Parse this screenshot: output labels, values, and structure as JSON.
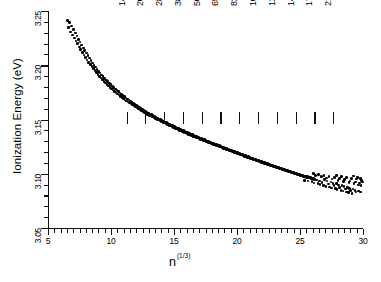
{
  "chart_data": {
    "type": "scatter",
    "title": "",
    "xlabel": "n (1/3)",
    "xlabel_base": "n",
    "xlabel_sup": "(1/3)",
    "ylabel": "Ionization Energy (eV)",
    "xlim": [
      5,
      30
    ],
    "ylim": [
      3.05,
      3.25
    ],
    "xticks": [
      5,
      10,
      15,
      20,
      25,
      30
    ],
    "xtick_labels": [
      "5",
      "10",
      "15",
      "20",
      "25",
      "30"
    ],
    "yticks": [
      3.05,
      3.1,
      3.15,
      3.2,
      3.25
    ],
    "ytick_labels": [
      "3.05",
      "3.10",
      "3.15",
      "3.20",
      "3.25"
    ],
    "x_minor_step": 0.5,
    "y_minor_step": 0.01,
    "grid": false,
    "legend": false,
    "marker": "filled-circle",
    "marker_color": "#000000",
    "annotations": [
      {
        "label": "1415",
        "n13": 11.23
      },
      {
        "label": "2057",
        "n13": 12.71
      },
      {
        "label": "2869",
        "n13": 14.2
      },
      {
        "label": "3871",
        "n13": 15.7
      },
      {
        "label": "5083",
        "n13": 17.19
      },
      {
        "label": "6525",
        "n13": 18.68
      },
      {
        "label": "8217",
        "n13": 20.18
      },
      {
        "label": "10179",
        "n13": 21.67
      },
      {
        "label": "12431",
        "n13": 23.16
      },
      {
        "label": "14993",
        "n13": 24.66
      },
      {
        "label": "17885",
        "n13": 26.15
      },
      {
        "label": "21127",
        "n13": 27.64
      }
    ],
    "points": [
      [
        6.55,
        3.2415
      ],
      [
        6.72,
        3.2392
      ],
      [
        6.62,
        3.235
      ],
      [
        6.88,
        3.2362
      ],
      [
        6.78,
        3.2305
      ],
      [
        7.02,
        3.233
      ],
      [
        6.95,
        3.228
      ],
      [
        7.18,
        3.2298
      ],
      [
        7.08,
        3.2252
      ],
      [
        7.3,
        3.227
      ],
      [
        7.22,
        3.2225
      ],
      [
        7.42,
        3.2238
      ],
      [
        7.35,
        3.2198
      ],
      [
        7.55,
        3.2215
      ],
      [
        7.48,
        3.217
      ],
      [
        7.68,
        3.2185
      ],
      [
        7.6,
        3.2145
      ],
      [
        7.8,
        3.216
      ],
      [
        7.73,
        3.212
      ],
      [
        7.92,
        3.2138
      ],
      [
        7.85,
        3.2095
      ],
      [
        8.05,
        3.2112
      ],
      [
        7.98,
        3.2072
      ],
      [
        8.18,
        3.209
      ],
      [
        8.1,
        3.205
      ],
      [
        8.3,
        3.2065
      ],
      [
        8.23,
        3.2028
      ],
      [
        8.42,
        3.2045
      ],
      [
        8.35,
        3.2008
      ],
      [
        8.55,
        3.2022
      ],
      [
        8.48,
        3.1988
      ],
      [
        8.66,
        3.2
      ],
      [
        8.6,
        3.1968
      ],
      [
        8.78,
        3.1982
      ],
      [
        8.72,
        3.195
      ],
      [
        8.9,
        3.1962
      ],
      [
        8.84,
        3.1932
      ],
      [
        9.02,
        3.1945
      ],
      [
        8.96,
        3.1915
      ],
      [
        9.14,
        3.1928
      ],
      [
        9.08,
        3.1898
      ],
      [
        9.26,
        3.191
      ],
      [
        9.2,
        3.1882
      ],
      [
        9.38,
        3.1895
      ],
      [
        9.32,
        3.1866
      ],
      [
        9.5,
        3.1878
      ],
      [
        9.44,
        3.185
      ],
      [
        9.62,
        3.1862
      ],
      [
        9.56,
        3.1836
      ],
      [
        9.74,
        3.1848
      ],
      [
        9.68,
        3.1822
      ],
      [
        9.86,
        3.1834
      ],
      [
        9.8,
        3.1808
      ],
      [
        9.98,
        3.182
      ],
      [
        9.92,
        3.1795
      ],
      [
        10.1,
        3.1806
      ],
      [
        10.04,
        3.1782
      ],
      [
        10.22,
        3.1793
      ],
      [
        10.16,
        3.177
      ],
      [
        10.34,
        3.178
      ],
      [
        10.28,
        3.1758
      ],
      [
        10.46,
        3.1768
      ],
      [
        10.4,
        3.1746
      ],
      [
        10.58,
        3.1756
      ],
      [
        10.52,
        3.1735
      ],
      [
        10.7,
        3.1744
      ],
      [
        10.64,
        3.1724
      ],
      [
        10.82,
        3.1732
      ],
      [
        10.76,
        3.1713
      ],
      [
        10.94,
        3.1721
      ],
      [
        10.88,
        3.1702
      ],
      [
        11.06,
        3.171
      ],
      [
        11.0,
        3.1692
      ],
      [
        11.18,
        3.1699
      ],
      [
        11.12,
        3.1681
      ],
      [
        11.3,
        3.1688
      ],
      [
        11.24,
        3.1671
      ],
      [
        11.42,
        3.1678
      ],
      [
        11.36,
        3.1661
      ],
      [
        11.54,
        3.1668
      ],
      [
        11.48,
        3.1651
      ],
      [
        11.66,
        3.1658
      ],
      [
        11.6,
        3.1642
      ],
      [
        11.78,
        3.1648
      ],
      [
        11.72,
        3.1632
      ],
      [
        11.9,
        3.1638
      ],
      [
        11.84,
        3.1623
      ],
      [
        12.02,
        3.1629
      ],
      [
        11.96,
        3.1614
      ],
      [
        12.14,
        3.162
      ],
      [
        12.08,
        3.1605
      ],
      [
        12.26,
        3.1611
      ],
      [
        12.2,
        3.1596
      ],
      [
        12.38,
        3.1602
      ],
      [
        12.32,
        3.1588
      ],
      [
        12.5,
        3.1593
      ],
      [
        12.44,
        3.1579
      ],
      [
        12.62,
        3.1585
      ],
      [
        12.56,
        3.1571
      ],
      [
        12.74,
        3.1576
      ],
      [
        12.68,
        3.1563
      ],
      [
        12.86,
        3.1568
      ],
      [
        12.8,
        3.1555
      ],
      [
        12.98,
        3.156
      ],
      [
        12.92,
        3.1547
      ],
      [
        13.1,
        3.1552
      ],
      [
        13.04,
        3.1539
      ],
      [
        13.22,
        3.1544
      ],
      [
        13.16,
        3.1531
      ],
      [
        13.34,
        3.1536
      ],
      [
        13.28,
        3.1524
      ],
      [
        13.46,
        3.1528
      ],
      [
        13.4,
        3.1516
      ],
      [
        13.58,
        3.1521
      ],
      [
        13.52,
        3.1509
      ],
      [
        13.7,
        3.1513
      ],
      [
        13.64,
        3.1501
      ],
      [
        13.82,
        3.1506
      ],
      [
        13.76,
        3.1494
      ],
      [
        13.94,
        3.1498
      ],
      [
        13.88,
        3.1487
      ],
      [
        14.06,
        3.1491
      ],
      [
        14.0,
        3.148
      ],
      [
        14.18,
        3.1484
      ],
      [
        14.12,
        3.1473
      ],
      [
        14.3,
        3.1477
      ],
      [
        14.24,
        3.1466
      ],
      [
        14.42,
        3.147
      ],
      [
        14.36,
        3.1459
      ],
      [
        14.54,
        3.1463
      ],
      [
        14.48,
        3.1452
      ],
      [
        14.66,
        3.1456
      ],
      [
        14.6,
        3.1446
      ],
      [
        14.78,
        3.1449
      ],
      [
        14.72,
        3.1439
      ],
      [
        14.9,
        3.1442
      ],
      [
        14.84,
        3.1432
      ],
      [
        15.02,
        3.1436
      ],
      [
        14.96,
        3.1426
      ],
      [
        15.14,
        3.1429
      ],
      [
        15.08,
        3.1419
      ],
      [
        15.26,
        3.1422
      ],
      [
        15.2,
        3.1412
      ],
      [
        15.38,
        3.1416
      ],
      [
        15.32,
        3.1406
      ],
      [
        15.5,
        3.1409
      ],
      [
        15.44,
        3.14
      ],
      [
        15.62,
        3.1403
      ],
      [
        15.56,
        3.1394
      ],
      [
        15.74,
        3.1397
      ],
      [
        15.68,
        3.1388
      ],
      [
        15.86,
        3.1391
      ],
      [
        15.8,
        3.1381
      ],
      [
        15.98,
        3.1385
      ],
      [
        15.92,
        3.1375
      ],
      [
        16.1,
        3.1378
      ],
      [
        16.04,
        3.1369
      ],
      [
        16.22,
        3.1372
      ],
      [
        16.16,
        3.1363
      ],
      [
        16.34,
        3.1366
      ],
      [
        16.28,
        3.1357
      ],
      [
        16.46,
        3.136
      ],
      [
        16.4,
        3.1351
      ],
      [
        16.58,
        3.1354
      ],
      [
        16.52,
        3.1345
      ],
      [
        16.7,
        3.1348
      ],
      [
        16.64,
        3.1339
      ],
      [
        16.82,
        3.1342
      ],
      [
        16.76,
        3.1334
      ],
      [
        16.94,
        3.1336
      ],
      [
        16.88,
        3.1328
      ],
      [
        17.06,
        3.133
      ],
      [
        17.0,
        3.1322
      ],
      [
        17.18,
        3.1325
      ],
      [
        17.12,
        3.1316
      ],
      [
        17.3,
        3.1319
      ],
      [
        17.24,
        3.1311
      ],
      [
        17.42,
        3.1313
      ],
      [
        17.36,
        3.1305
      ],
      [
        17.54,
        3.1308
      ],
      [
        17.48,
        3.13
      ],
      [
        17.66,
        3.1302
      ],
      [
        17.6,
        3.1294
      ],
      [
        17.78,
        3.1296
      ],
      [
        17.72,
        3.1288
      ],
      [
        17.9,
        3.1291
      ],
      [
        17.84,
        3.1283
      ],
      [
        18.02,
        3.1285
      ],
      [
        17.96,
        3.1277
      ],
      [
        18.14,
        3.128
      ],
      [
        18.08,
        3.1272
      ],
      [
        18.26,
        3.1274
      ],
      [
        18.2,
        3.1266
      ],
      [
        18.38,
        3.1269
      ],
      [
        18.32,
        3.1261
      ],
      [
        18.5,
        3.1263
      ],
      [
        18.44,
        3.1256
      ],
      [
        18.62,
        3.1258
      ],
      [
        18.56,
        3.125
      ],
      [
        18.74,
        3.1252
      ],
      [
        18.68,
        3.1245
      ],
      [
        18.86,
        3.1247
      ],
      [
        18.8,
        3.1239
      ],
      [
        18.98,
        3.1241
      ],
      [
        18.92,
        3.1234
      ],
      [
        19.1,
        3.1236
      ],
      [
        19.04,
        3.1229
      ],
      [
        19.22,
        3.1231
      ],
      [
        19.16,
        3.1223
      ],
      [
        19.34,
        3.1226
      ],
      [
        19.28,
        3.1218
      ],
      [
        19.46,
        3.122
      ],
      [
        19.4,
        3.1213
      ],
      [
        19.58,
        3.1215
      ],
      [
        19.52,
        3.1208
      ],
      [
        19.7,
        3.121
      ],
      [
        19.64,
        3.1202
      ],
      [
        19.82,
        3.1204
      ],
      [
        19.76,
        3.1197
      ],
      [
        19.94,
        3.1199
      ],
      [
        19.88,
        3.1192
      ],
      [
        20.06,
        3.1194
      ],
      [
        20.0,
        3.1187
      ],
      [
        20.18,
        3.1189
      ],
      [
        20.12,
        3.1182
      ],
      [
        20.3,
        3.1183
      ],
      [
        20.24,
        3.1176
      ],
      [
        20.42,
        3.1178
      ],
      [
        20.36,
        3.1171
      ],
      [
        20.54,
        3.1173
      ],
      [
        20.48,
        3.1166
      ],
      [
        20.66,
        3.1168
      ],
      [
        20.6,
        3.1161
      ],
      [
        20.78,
        3.1163
      ],
      [
        20.72,
        3.1156
      ],
      [
        20.9,
        3.1158
      ],
      [
        20.84,
        3.1151
      ],
      [
        21.02,
        3.1152
      ],
      [
        20.96,
        3.1146
      ],
      [
        21.14,
        3.1147
      ],
      [
        21.08,
        3.1141
      ],
      [
        21.26,
        3.1142
      ],
      [
        21.2,
        3.1136
      ],
      [
        21.38,
        3.1137
      ],
      [
        21.32,
        3.1131
      ],
      [
        21.5,
        3.1132
      ],
      [
        21.44,
        3.1126
      ],
      [
        21.62,
        3.1127
      ],
      [
        21.56,
        3.1121
      ],
      [
        21.74,
        3.1122
      ],
      [
        21.68,
        3.1116
      ],
      [
        21.86,
        3.1117
      ],
      [
        21.8,
        3.1111
      ],
      [
        21.98,
        3.1112
      ],
      [
        21.92,
        3.1106
      ],
      [
        22.1,
        3.1107
      ],
      [
        22.04,
        3.1101
      ],
      [
        22.22,
        3.1102
      ],
      [
        22.16,
        3.1096
      ],
      [
        22.34,
        3.1097
      ],
      [
        22.28,
        3.1091
      ],
      [
        22.46,
        3.1092
      ],
      [
        22.4,
        3.1086
      ],
      [
        22.58,
        3.1087
      ],
      [
        22.52,
        3.1081
      ],
      [
        22.7,
        3.1082
      ],
      [
        22.64,
        3.1076
      ],
      [
        22.82,
        3.1077
      ],
      [
        22.76,
        3.1071
      ],
      [
        22.94,
        3.1072
      ],
      [
        22.88,
        3.1067
      ],
      [
        23.06,
        3.1067
      ],
      [
        23.0,
        3.1062
      ],
      [
        23.18,
        3.1062
      ],
      [
        23.12,
        3.1057
      ],
      [
        23.3,
        3.1057
      ],
      [
        23.24,
        3.1052
      ],
      [
        23.42,
        3.1052
      ],
      [
        23.36,
        3.1047
      ],
      [
        23.54,
        3.1048
      ],
      [
        23.48,
        3.1042
      ],
      [
        23.66,
        3.1043
      ],
      [
        23.6,
        3.1038
      ],
      [
        23.78,
        3.1038
      ],
      [
        23.72,
        3.1033
      ],
      [
        23.9,
        3.1033
      ],
      [
        23.84,
        3.1028
      ],
      [
        24.02,
        3.1029
      ],
      [
        23.96,
        3.1024
      ],
      [
        24.14,
        3.1024
      ],
      [
        24.08,
        3.1019
      ],
      [
        24.26,
        3.1019
      ],
      [
        24.2,
        3.1015
      ],
      [
        24.38,
        3.1015
      ],
      [
        24.32,
        3.101
      ],
      [
        24.5,
        3.101
      ],
      [
        24.44,
        3.1006
      ],
      [
        24.62,
        3.1006
      ],
      [
        24.56,
        3.1001
      ],
      [
        24.74,
        3.1002
      ],
      [
        24.68,
        3.0997
      ],
      [
        24.86,
        3.0997
      ],
      [
        24.8,
        3.0993
      ],
      [
        24.98,
        3.0993
      ],
      [
        24.92,
        3.0989
      ],
      [
        25.1,
        3.0988
      ],
      [
        25.04,
        3.0984
      ],
      [
        25.22,
        3.0984
      ],
      [
        25.16,
        3.098
      ],
      [
        25.34,
        3.098
      ],
      [
        25.28,
        3.0976
      ],
      [
        25.46,
        3.0976
      ],
      [
        25.4,
        3.0972
      ],
      [
        25.58,
        3.0972
      ],
      [
        25.52,
        3.0968
      ],
      [
        25.7,
        3.0968
      ],
      [
        25.64,
        3.0964
      ],
      [
        25.82,
        3.0964
      ],
      [
        25.76,
        3.096
      ],
      [
        25.94,
        3.096
      ],
      [
        25.88,
        3.0956
      ],
      [
        26.06,
        3.0956
      ],
      [
        26.0,
        3.0952
      ],
      [
        26.18,
        3.0952
      ],
      [
        26.12,
        3.0948
      ],
      [
        25.35,
        3.0938
      ],
      [
        25.62,
        3.0932
      ],
      [
        25.95,
        3.0928
      ],
      [
        26.3,
        3.0943
      ],
      [
        26.55,
        3.0935
      ],
      [
        26.1,
        3.0915
      ],
      [
        26.42,
        3.0908
      ],
      [
        26.75,
        3.0922
      ],
      [
        26.95,
        3.0948
      ],
      [
        27.15,
        3.0932
      ],
      [
        26.6,
        3.09
      ],
      [
        26.88,
        3.0893
      ],
      [
        27.25,
        3.0905
      ],
      [
        27.45,
        3.0925
      ],
      [
        27.62,
        3.0912
      ],
      [
        27.05,
        3.0885
      ],
      [
        27.35,
        3.0878
      ],
      [
        27.7,
        3.089
      ],
      [
        27.88,
        3.0908
      ],
      [
        28.05,
        3.0895
      ],
      [
        27.5,
        3.087
      ],
      [
        27.8,
        3.0862
      ],
      [
        28.15,
        3.0875
      ],
      [
        28.32,
        3.0892
      ],
      [
        28.5,
        3.088
      ],
      [
        27.95,
        3.0855
      ],
      [
        28.25,
        3.0848
      ],
      [
        28.6,
        3.086
      ],
      [
        28.78,
        3.0875
      ],
      [
        28.95,
        3.0862
      ],
      [
        28.4,
        3.084
      ],
      [
        28.68,
        3.0833
      ],
      [
        29.02,
        3.0845
      ],
      [
        29.2,
        3.0858
      ],
      [
        29.38,
        3.0848
      ],
      [
        28.85,
        3.0826
      ],
      [
        29.12,
        3.082
      ],
      [
        29.45,
        3.083
      ],
      [
        29.62,
        3.0842
      ],
      [
        29.78,
        3.0832
      ],
      [
        26.25,
        3.0985
      ],
      [
        26.7,
        3.0972
      ],
      [
        27.1,
        3.0962
      ],
      [
        27.55,
        3.095
      ],
      [
        28.0,
        3.094
      ],
      [
        28.45,
        3.093
      ],
      [
        28.9,
        3.0918
      ],
      [
        29.3,
        3.0908
      ],
      [
        29.65,
        3.0898
      ],
      [
        29.85,
        3.089
      ],
      [
        26.05,
        3.1005
      ],
      [
        26.48,
        3.0995
      ],
      [
        26.9,
        3.0985
      ],
      [
        27.3,
        3.0975
      ],
      [
        27.72,
        3.0965
      ],
      [
        28.12,
        3.0955
      ],
      [
        28.55,
        3.0945
      ],
      [
        28.98,
        3.0935
      ],
      [
        29.4,
        3.0925
      ],
      [
        29.72,
        3.0915
      ],
      [
        27.9,
        3.0985
      ],
      [
        28.3,
        3.0975
      ],
      [
        28.7,
        3.0968
      ],
      [
        29.1,
        3.0958
      ],
      [
        29.5,
        3.095
      ],
      [
        29.25,
        3.0978
      ],
      [
        29.55,
        3.0968
      ],
      [
        29.8,
        3.0958
      ],
      [
        29.9,
        3.094
      ],
      [
        29.95,
        3.0925
      ]
    ]
  }
}
